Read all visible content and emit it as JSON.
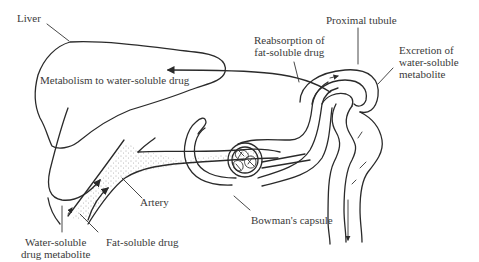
{
  "diagram": {
    "type": "anatomical-flow-diagram",
    "labels": {
      "liver": "Liver",
      "metabolism": "Metabolism to water-soluble drug",
      "reabsorption_line1": "Reabsorption of",
      "reabsorption_line2": "fat-soluble drug",
      "proximal_tubule": "Proximal tubule",
      "excretion_line1": "Excretion of",
      "excretion_line2": "water-soluble",
      "excretion_line3": "metabolite",
      "artery": "Artery",
      "bowmans_capsule": "Bowman's capsule",
      "water_soluble_line1": "Water-soluble",
      "water_soluble_line2": "drug metabolite",
      "fat_soluble": "Fat-soluble drug"
    },
    "structures": [
      "liver",
      "artery",
      "glomerulus",
      "bowmans-capsule",
      "proximal-tubule"
    ],
    "colors": {
      "ink": "#2a2a2a",
      "text": "#3a3a3a",
      "stipple": "#555555",
      "background": "#ffffff"
    }
  }
}
